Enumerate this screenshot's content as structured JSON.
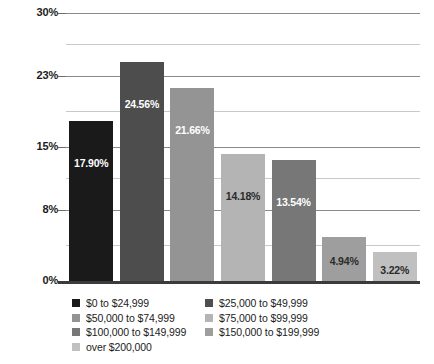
{
  "chart_data": {
    "type": "bar",
    "title": "",
    "subtitle": "",
    "xlabel": "",
    "ylabel": "",
    "ylim": [
      0,
      30
    ],
    "grid": true,
    "legend_position": "bottom",
    "categories": [
      "$0 to $24,999",
      "$25,000 to $49,999",
      "$50,000 to $74,999",
      "$75,000 to $99,999",
      "$100,000 to $149,999",
      "$150,000 to $199,999",
      "over $200,000"
    ],
    "values": [
      17.9,
      24.56,
      21.66,
      14.18,
      13.54,
      4.94,
      3.22
    ],
    "data_labels": [
      "17.90%",
      "24.56%",
      "21.66%",
      "14.18%",
      "13.54%",
      "4.94%",
      "3.22%"
    ],
    "bar_colors": [
      "#1a1a1a",
      "#4d4d4d",
      "#949494",
      "#b4b4b4",
      "#777777",
      "#9e9e9e",
      "#c0c0c0"
    ],
    "data_label_colors": [
      "#ffffff",
      "#ffffff",
      "#ffffff",
      "#2b2b2b",
      "#ffffff",
      "#2b2b2b",
      "#2b2b2b"
    ],
    "ytick_labels": [
      "30%",
      "23%",
      "15%",
      "8%",
      "0%"
    ],
    "ytick_values": [
      30,
      23,
      15,
      8,
      0
    ],
    "minor_gridline_values": [
      26.5,
      19,
      11.5,
      4
    ]
  },
  "legend": {
    "column1": [
      {
        "label": "$0 to $24,999",
        "color": "#1a1a1a"
      },
      {
        "label": "$50,000 to $74,999",
        "color": "#949494"
      },
      {
        "label": "$100,000 to $149,999",
        "color": "#777777"
      },
      {
        "label": "over $200,000",
        "color": "#c0c0c0"
      }
    ],
    "column2": [
      {
        "label": "$25,000 to $49,999",
        "color": "#4d4d4d"
      },
      {
        "label": "$75,000 to $99,999",
        "color": "#b4b4b4"
      },
      {
        "label": "$150,000 to $199,999",
        "color": "#9e9e9e"
      }
    ]
  }
}
